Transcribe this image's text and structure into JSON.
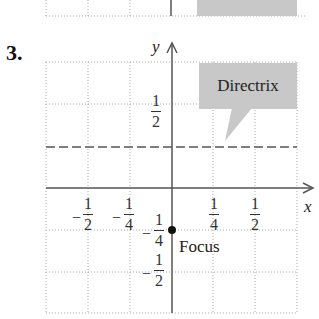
{
  "problem_number": "3.",
  "axes": {
    "x_label": "x",
    "y_label": "y"
  },
  "x_ticks": [
    {
      "sign": "−",
      "num": "1",
      "den": "2"
    },
    {
      "sign": "−",
      "num": "1",
      "den": "4"
    },
    {
      "sign": "",
      "num": "1",
      "den": "4"
    },
    {
      "sign": "",
      "num": "1",
      "den": "2"
    }
  ],
  "y_ticks": [
    {
      "sign": "",
      "num": "1",
      "den": "2"
    },
    {
      "sign": "−",
      "num": "1",
      "den": "4"
    },
    {
      "sign": "−",
      "num": "1",
      "den": "2"
    }
  ],
  "callout": {
    "label": "Directrix"
  },
  "focus": {
    "label": "Focus",
    "x": 0,
    "y": -0.25
  },
  "directrix": {
    "y": 0.25
  },
  "colors": {
    "grid": "#aaaaaa",
    "axis": "#555555",
    "callout_bg": "#c8c8c8",
    "dashed_line": "#555555"
  }
}
